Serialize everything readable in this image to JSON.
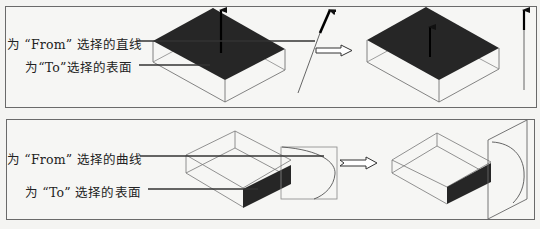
{
  "panels": [
    {
      "id": "top",
      "labels": {
        "from": "为 “From” 选择的直线",
        "to": "为“To”选择的表面"
      },
      "description": "Straight line selected as From, surface selected as To"
    },
    {
      "id": "bottom",
      "labels": {
        "from": "为 “From” 选择的曲线",
        "to": "为 “To” 选择的表面"
      },
      "description": "Curve selected as From, surface selected as To"
    }
  ],
  "colors": {
    "face_fill": "#262626",
    "line": "#555555",
    "border": "#6a6a6a",
    "background": "#f6f6f4"
  }
}
